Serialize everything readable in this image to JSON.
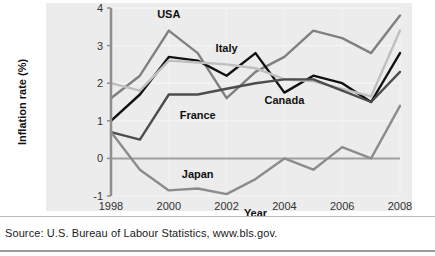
{
  "source_note": "Source: U.S. Bureau of Labour Statistics, www.bls.gov.",
  "chart_data": {
    "type": "line",
    "title": "",
    "xlabel": "Year",
    "ylabel": "Inflation rate (%)",
    "x": [
      1998,
      1999,
      2000,
      2001,
      2002,
      2003,
      2004,
      2005,
      2006,
      2007,
      2008
    ],
    "xlim": [
      1998,
      2008
    ],
    "ylim": [
      -1,
      4
    ],
    "xticks": [
      1998,
      2000,
      2002,
      2004,
      2006,
      2008
    ],
    "xtick_labels": [
      "1998",
      "2000",
      "2002",
      "2004",
      "2006",
      "2008"
    ],
    "yticks": [
      -1,
      0,
      1,
      2,
      3,
      4
    ],
    "ytick_labels": [
      "-1",
      "0",
      "1",
      "2",
      "3",
      "4"
    ],
    "grid": true,
    "legend": "inline-labels",
    "zero_line": true,
    "series": [
      {
        "name": "USA",
        "color": "#808080",
        "label_x": 2000,
        "label_y": 3.85,
        "values": [
          1.6,
          2.2,
          3.4,
          2.8,
          1.6,
          2.3,
          2.7,
          3.4,
          3.2,
          2.8,
          3.8
        ]
      },
      {
        "name": "Italy",
        "color": "#111111",
        "label_x": 2002,
        "label_y": 2.95,
        "values": [
          1.0,
          1.7,
          2.7,
          2.6,
          2.2,
          2.8,
          1.75,
          2.2,
          2.0,
          1.5,
          2.8
        ]
      },
      {
        "name": "Canada",
        "color": "#bfbfbf",
        "label_x": 2004,
        "label_y": 1.55,
        "values": [
          2.0,
          1.8,
          2.6,
          2.55,
          2.5,
          2.4,
          2.1,
          2.05,
          1.85,
          1.65,
          3.4
        ]
      },
      {
        "name": "France",
        "color": "#4d4d4d",
        "label_x": 2001,
        "label_y": 1.15,
        "values": [
          0.7,
          0.5,
          1.7,
          1.7,
          1.85,
          2.0,
          2.1,
          2.1,
          1.8,
          1.5,
          2.3
        ]
      },
      {
        "name": "Japan",
        "color": "#8c8c8c",
        "label_x": 2001,
        "label_y": -0.42,
        "values": [
          0.7,
          -0.3,
          -0.85,
          -0.8,
          -0.95,
          -0.55,
          0.0,
          -0.3,
          0.3,
          0.0,
          1.4
        ]
      }
    ]
  }
}
